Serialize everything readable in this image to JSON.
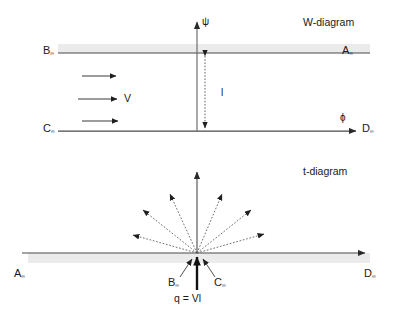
{
  "figure": {
    "background_color": "#ffffff",
    "line_color": "#3a3a3a",
    "band_color": "#ebebeb",
    "text_color": "#1a1a1a"
  },
  "w_diagram": {
    "title": "W-diagram",
    "vertical_axis_symbol": "ψ",
    "horizontal_axis_symbol": "ϕ",
    "corner_top_left": {
      "base": "B",
      "sub": "∞"
    },
    "corner_top_right": {
      "base": "A",
      "sub": "∞"
    },
    "corner_bottom_left": {
      "base": "C",
      "sub": "∞"
    },
    "corner_bottom_right": {
      "base": "D",
      "sub": "∞"
    },
    "velocity_label": "V",
    "length_label": "l",
    "velocity_arrow_count": 3,
    "stream_line_y_top": 53,
    "stream_line_y_bottom": 131
  },
  "t_diagram": {
    "title": "t-diagram",
    "corner_left": {
      "base": "A",
      "sub": "∞"
    },
    "corner_right": {
      "base": "D",
      "sub": "∞"
    },
    "source_label_left": {
      "base": "B",
      "sub": "∞"
    },
    "source_label_right": {
      "base": "C",
      "sub": "∞"
    },
    "strength_equation": "q = Vl",
    "radial_dashed_arrow_count": 6,
    "axis_y": 253,
    "origin_x": 197
  }
}
